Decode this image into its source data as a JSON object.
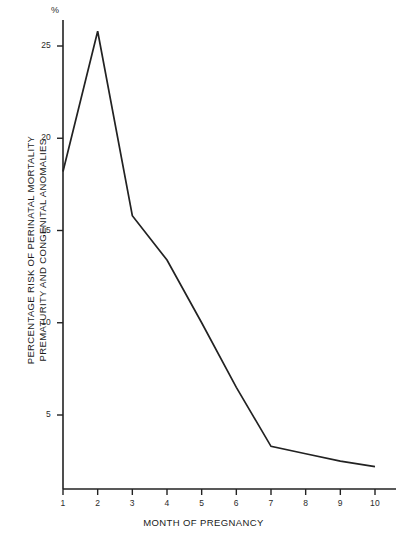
{
  "chart_data": {
    "type": "line",
    "title": "",
    "subtitle": "",
    "xlabel": "MONTH OF PREGNANCY",
    "ylabel_line1": "PERCENTAGE RISK OF PERINATAL MORTALITY",
    "ylabel_line2": "PREMATURITY AND CONGENITAL ANOMALIES",
    "unit_label": "%",
    "x": [
      1,
      2,
      3,
      4,
      5,
      6,
      7,
      8,
      9,
      10
    ],
    "values": [
      18.2,
      25.8,
      15.8,
      13.4,
      10.0,
      6.5,
      3.3,
      2.9,
      2.5,
      2.2
    ],
    "xlim": [
      1,
      10
    ],
    "ylim": [
      0,
      27.5
    ],
    "xticks": [
      "1",
      "2",
      "3",
      "4",
      "5",
      "6",
      "7",
      "8",
      "9",
      "10"
    ],
    "yticks": [
      "5",
      "10",
      "15",
      "20",
      "25"
    ],
    "ytick_values": [
      5,
      10,
      15,
      20,
      25
    ],
    "grid": false,
    "legend": false,
    "legend_position": "none",
    "line_color": "#222222",
    "axis_color": "#222222",
    "background_color": "#ffffff"
  }
}
